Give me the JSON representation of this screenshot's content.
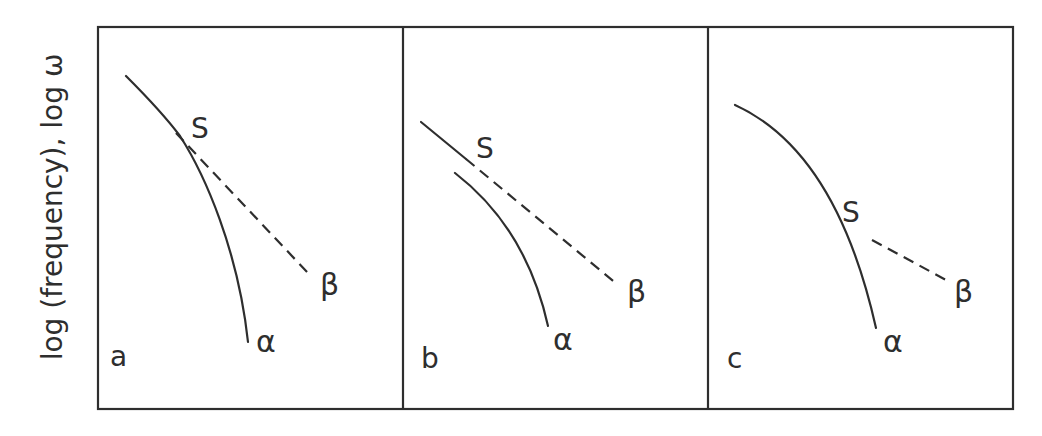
{
  "figure": {
    "y_axis_label": "log (frequency), log ω",
    "panels": [
      {
        "id": "a",
        "letter": "a",
        "s_label": "S",
        "alpha_label": "α",
        "beta_label": "β",
        "description": "Solid curve alpha branches from shared line at S; dashed beta line continues from S"
      },
      {
        "id": "b",
        "letter": "b",
        "s_label": "S",
        "alpha_label": "α",
        "beta_label": "β",
        "description": "Solid line meets S then continues as dashed beta; separate alpha curve below"
      },
      {
        "id": "c",
        "letter": "c",
        "s_label": "S",
        "alpha_label": "α",
        "beta_label": "β",
        "description": "Single solid curve through S ending at alpha; short detached dashed beta segment"
      }
    ],
    "colors": {
      "stroke": "#2e2e2e",
      "background": "#ffffff"
    }
  }
}
